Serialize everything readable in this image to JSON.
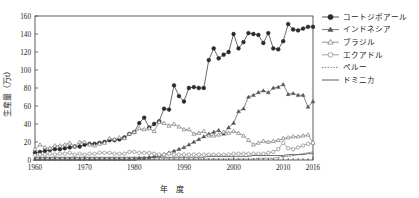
{
  "chart_data": {
    "type": "line",
    "title": "",
    "xlabel": "年　度",
    "ylabel": "生産量（万t）",
    "xlim": [
      1960,
      2016
    ],
    "ylim": [
      0,
      160
    ],
    "xticks": [
      1960,
      1970,
      1980,
      1990,
      2000,
      2010,
      2016
    ],
    "yticks": [
      0,
      20,
      40,
      60,
      80,
      100,
      120,
      140,
      160
    ],
    "grid": false,
    "legend_position": "right",
    "x": [
      1960,
      1961,
      1962,
      1963,
      1964,
      1965,
      1966,
      1967,
      1968,
      1969,
      1970,
      1971,
      1972,
      1973,
      1974,
      1975,
      1976,
      1977,
      1978,
      1979,
      1980,
      1981,
      1982,
      1983,
      1984,
      1985,
      1986,
      1987,
      1988,
      1989,
      1990,
      1991,
      1992,
      1993,
      1994,
      1995,
      1996,
      1997,
      1998,
      1999,
      2000,
      2001,
      2002,
      2003,
      2004,
      2005,
      2006,
      2007,
      2008,
      2009,
      2010,
      2011,
      2012,
      2013,
      2014,
      2015,
      2016
    ],
    "series": [
      {
        "name": "コートジボアール",
        "marker": "filled-circle",
        "color": "#2b2b2b",
        "values": [
          8,
          9,
          10,
          11,
          12,
          12,
          13,
          14,
          15,
          15,
          17,
          18,
          18,
          19,
          20,
          22,
          22,
          23,
          25,
          29,
          31,
          41,
          47,
          36,
          40,
          43,
          57,
          56,
          83,
          71,
          65,
          80,
          81,
          80,
          80,
          111,
          124,
          113,
          117,
          120,
          140,
          124,
          131,
          141,
          140,
          139,
          130,
          141,
          124,
          123,
          132,
          151,
          145,
          144,
          146,
          148,
          148
        ]
      },
      {
        "name": "インドネシア",
        "marker": "filled-triangle",
        "color": "#555555",
        "values": [
          1,
          1,
          1,
          1,
          1,
          1,
          1,
          1,
          1,
          1,
          1,
          1,
          1,
          1,
          1,
          1,
          1,
          1,
          1,
          1,
          1,
          2,
          2,
          3,
          4,
          5,
          6,
          8,
          10,
          12,
          14,
          17,
          20,
          23,
          26,
          29,
          31,
          33,
          29,
          36,
          41,
          54,
          57,
          70,
          72,
          75,
          77,
          75,
          80,
          81,
          84,
          73,
          74,
          72,
          72,
          59,
          65
        ]
      },
      {
        "name": "ブラジル",
        "marker": "open-triangle",
        "color": "#7a7a7a",
        "values": [
          12,
          17,
          14,
          13,
          16,
          16,
          17,
          19,
          15,
          20,
          20,
          17,
          16,
          18,
          19,
          24,
          23,
          25,
          24,
          29,
          31,
          35,
          34,
          35,
          32,
          42,
          41,
          38,
          40,
          37,
          34,
          34,
          29,
          30,
          32,
          27,
          27,
          28,
          31,
          30,
          32,
          30,
          27,
          22,
          17,
          19,
          21,
          20,
          21,
          22,
          24,
          25,
          26,
          26,
          27,
          28,
          19
        ]
      },
      {
        "name": "エクアドル",
        "marker": "open-circle",
        "color": "#888888",
        "values": [
          5,
          6,
          6,
          7,
          6,
          7,
          7,
          8,
          6,
          7,
          6,
          7,
          7,
          8,
          8,
          8,
          7,
          7,
          7,
          9,
          9,
          8,
          8,
          8,
          7,
          6,
          6,
          7,
          6,
          6,
          6,
          6,
          6,
          6,
          6,
          6,
          6,
          6,
          6,
          6,
          7,
          7,
          7,
          7,
          7,
          7,
          7,
          8,
          9,
          12,
          19,
          13,
          12,
          14,
          16,
          18,
          19
        ]
      },
      {
        "name": "ペルー",
        "marker": "dotted-line",
        "color": "#666666",
        "values": [
          0.2,
          0.2,
          0.2,
          0.2,
          0.2,
          0.2,
          0.2,
          0.2,
          0.2,
          0.2,
          0.2,
          0.2,
          0.2,
          0.2,
          0.3,
          0.3,
          0.3,
          0.3,
          0.4,
          0.4,
          0.4,
          0.4,
          0.5,
          0.6,
          0.8,
          1,
          1.2,
          1.2,
          1.2,
          1,
          1,
          1,
          1,
          1,
          1,
          1,
          1,
          1,
          1,
          1,
          1,
          1,
          1,
          1,
          1,
          2,
          2,
          2,
          2,
          3,
          4,
          4,
          5,
          6,
          7,
          8,
          9
        ]
      },
      {
        "name": "ドミニカ",
        "marker": "solid-line",
        "color": "#4a4a4a",
        "values": [
          3,
          3,
          3,
          3,
          3,
          3,
          3,
          3,
          3,
          3,
          3,
          3,
          3,
          3,
          3,
          3,
          3,
          3,
          3,
          3,
          3,
          3,
          3,
          3,
          3,
          3,
          3,
          3,
          3,
          3,
          3,
          3,
          3,
          3,
          3,
          4,
          4,
          4,
          4,
          4,
          4,
          4,
          4,
          4,
          5,
          5,
          5,
          5,
          5,
          5,
          5,
          6,
          6,
          6,
          6,
          7,
          7
        ]
      }
    ]
  },
  "legend": {
    "items": [
      {
        "label": "コートジボアール",
        "marker": "filled-circle"
      },
      {
        "label": "インドネシア",
        "marker": "filled-triangle"
      },
      {
        "label": "ブラジル",
        "marker": "open-triangle"
      },
      {
        "label": "エクアドル",
        "marker": "open-circle"
      },
      {
        "label": "ペルー",
        "marker": "dotted-line"
      },
      {
        "label": "ドミニカ",
        "marker": "solid-line"
      }
    ]
  },
  "axes": {
    "y_title": "生産量（万t）",
    "x_title": "年　度",
    "y_tick_labels": [
      "0",
      "20",
      "40",
      "60",
      "80",
      "100",
      "120",
      "140",
      "160"
    ],
    "x_tick_labels": [
      "1960",
      "1970",
      "1980",
      "1990",
      "2000",
      "2010",
      "2016"
    ]
  }
}
